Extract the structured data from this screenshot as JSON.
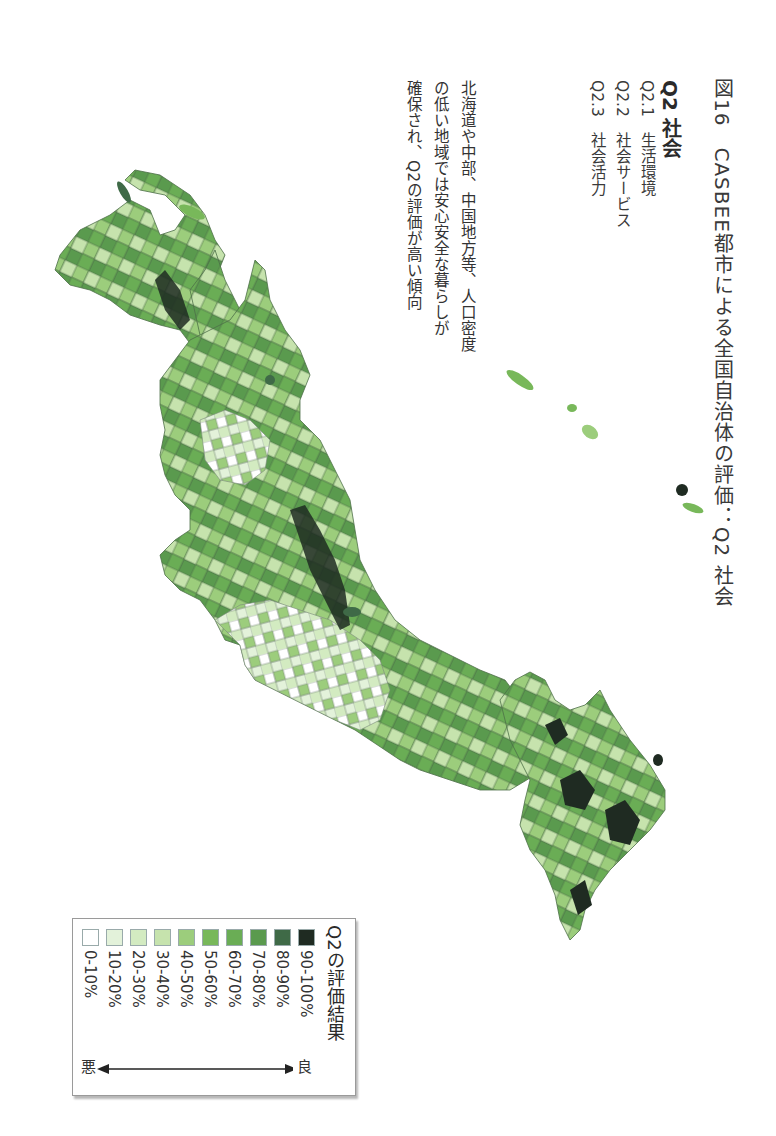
{
  "figure": {
    "title": "図16　CASBEE都市による全国自治体の評価：Q2 社会",
    "section": "Q2 社会",
    "items": [
      {
        "code": "Q2.1",
        "label": "生活環境"
      },
      {
        "code": "Q2.2",
        "label": "社会サービス"
      },
      {
        "code": "Q2.3",
        "label": "社会活力"
      }
    ],
    "caption_lines": [
      "北海道や中部、中国地方等、人口密度",
      "の低い地域では安心安全な暮らしが",
      "確保され、Q2の評価が高い傾向"
    ]
  },
  "legend": {
    "title": "Q2の評価結果",
    "good_label": "良",
    "bad_label": "悪",
    "classes": [
      {
        "label": "90-100%",
        "color": "#1f2b22"
      },
      {
        "label": "80-90%",
        "color": "#3f6a47"
      },
      {
        "label": "70-80%",
        "color": "#5a9a4e"
      },
      {
        "label": "60-70%",
        "color": "#6aad55"
      },
      {
        "label": "50-60%",
        "color": "#78b85a"
      },
      {
        "label": "40-50%",
        "color": "#9ccd7c"
      },
      {
        "label": "30-40%",
        "color": "#c6e3ad"
      },
      {
        "label": "20-30%",
        "color": "#d3ebc1"
      },
      {
        "label": "10-20%",
        "color": "#e3f2da"
      },
      {
        "label": "0-10%",
        "color": "#ffffff"
      }
    ]
  },
  "map": {
    "subject": "Japan municipalities choropleth (rotated 90°)",
    "regions_visible": [
      "Hokkaido",
      "Honshu",
      "Shikoku",
      "Kyushu",
      "Okinawa islands"
    ]
  }
}
